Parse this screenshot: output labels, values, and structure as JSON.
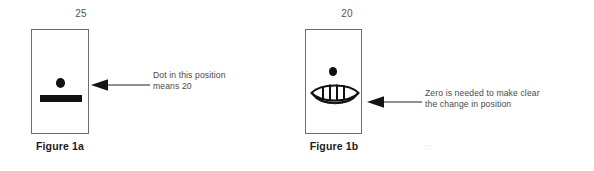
{
  "page": {
    "background_color": "#ffffff",
    "ink_color": "#111111",
    "box_stroke_color": "#6d6d70",
    "text_color": "#4a4a4a",
    "caption_color": "#1b1b1b",
    "watermark_text": "m"
  },
  "figures": [
    {
      "id": "1a",
      "top_value": "25",
      "caption": "Figure 1a",
      "glyphs": [
        "dot",
        "bar"
      ],
      "annotation": "Dot in this position\nmeans 20",
      "arrow_direction": "left"
    },
    {
      "id": "1b",
      "top_value": "20",
      "caption": "Figure 1b",
      "glyphs": [
        "dot",
        "shell-zero"
      ],
      "annotation": "Zero is needed to make clear\nthe change in position",
      "arrow_direction": "left"
    }
  ]
}
